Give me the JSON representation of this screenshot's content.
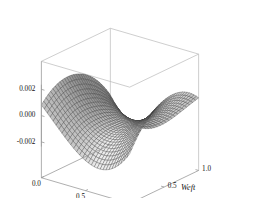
{
  "chart_data": {
    "type": "surface3d",
    "title": "",
    "xlabel": "Warp",
    "ylabel": "Weft",
    "zlabel": "",
    "xlim": [
      0.0,
      1.0
    ],
    "ylim": [
      0.0,
      1.0
    ],
    "zlim": [
      -0.0028,
      0.0028
    ],
    "xticks": [
      "0.0",
      "0.5",
      "1.0"
    ],
    "xtick_values": [
      0.0,
      0.5,
      1.0
    ],
    "yticks": [
      "0.0",
      "0.5",
      "1.0"
    ],
    "ytick_values": [
      0.0,
      0.5,
      1.0
    ],
    "zticks": [
      "0.002",
      "0.000",
      "-0.002"
    ],
    "ztick_values": [
      0.002,
      0.0,
      -0.002
    ],
    "grid": true,
    "legend": false,
    "mesh_n": 30,
    "surface_kind": "saddle",
    "amplitude": 0.0024,
    "view": {
      "azimuth_deg": 38,
      "elevation_deg": 22,
      "projection": "parallel"
    },
    "colors": {
      "background": "#ffffff",
      "mesh_line": "#3a3a3a",
      "surface_light": "#e8e8e8",
      "surface_dark": "#6e6e6e",
      "box": "#b9b9b9",
      "text": "#111111"
    }
  },
  "axes": {
    "x": {
      "title": "Warp",
      "ticks": [
        "0.0",
        "0.5",
        "1.0"
      ]
    },
    "y": {
      "title": "Weft",
      "ticks": [
        "0.0",
        "0.5",
        "1.0"
      ]
    },
    "z": {
      "ticks": [
        "0.002",
        "0.000",
        "-0.002"
      ]
    }
  }
}
